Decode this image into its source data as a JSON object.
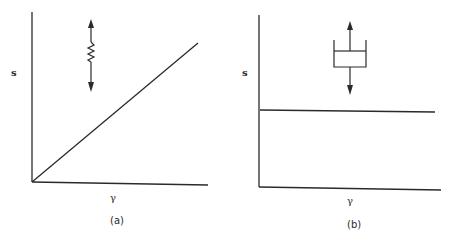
{
  "figure": {
    "panels": [
      {
        "id": "a",
        "caption": "(a)",
        "ylabel": "s",
        "xlabel": "γ",
        "element": "spring",
        "element_icon": "spring-icon",
        "curve": "linear through origin"
      },
      {
        "id": "b",
        "caption": "(b)",
        "ylabel": "s",
        "xlabel": "γ",
        "element": "dashpot",
        "element_icon": "dashpot-icon",
        "curve": "constant horizontal line"
      }
    ],
    "colors": {
      "ink": "#2a2a2a",
      "background": "#ffffff"
    }
  }
}
